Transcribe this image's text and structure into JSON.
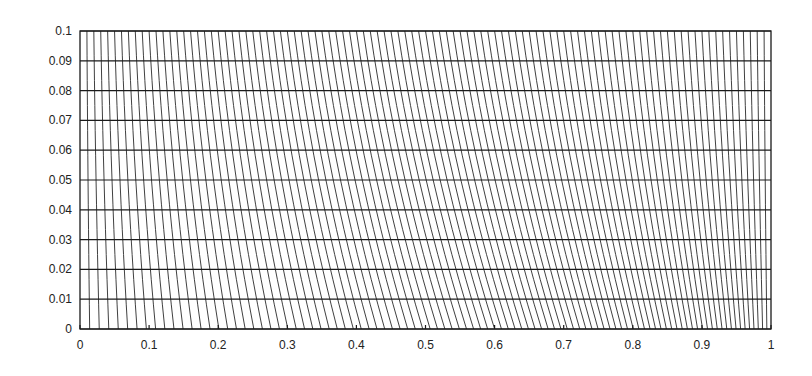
{
  "chart_data": {
    "type": "line",
    "title": "",
    "xlabel": "",
    "ylabel": "",
    "xlim": [
      0,
      1
    ],
    "ylim": [
      0,
      0.1
    ],
    "grid": true,
    "legend": null,
    "x_ticks": [
      0,
      0.1,
      0.2,
      0.3,
      0.4,
      0.5,
      0.6,
      0.7,
      0.8,
      0.9,
      1
    ],
    "x_tick_labels": [
      "0",
      "0.1",
      "0.2",
      "0.3",
      "0.4",
      "0.5",
      "0.6",
      "0.7",
      "0.8",
      "0.9",
      "1"
    ],
    "y_ticks": [
      0,
      0.01,
      0.02,
      0.03,
      0.04,
      0.05,
      0.06,
      0.07,
      0.08,
      0.09,
      0.1
    ],
    "y_tick_labels": [
      "0",
      "0.01",
      "0.02",
      "0.03",
      "0.04",
      "0.05",
      "0.06",
      "0.07",
      "0.08",
      "0.09",
      "0.1"
    ],
    "mesh": {
      "horizontal_lines_y": [
        0,
        0.01,
        0.02,
        0.03,
        0.04,
        0.05,
        0.06,
        0.07,
        0.08,
        0.09,
        0.1
      ],
      "vertical_line_count": 100,
      "top_distribution": "uniform",
      "bottom_grading_coefficient": 0.4,
      "note": "Vertical lines run from uniform spacing at y=0.1 to graded spacing at y=0 (coarser near x=0, finer near x=1), producing a rightward lean"
    }
  },
  "plot_area": {
    "left": 80,
    "top": 31,
    "right": 771,
    "bottom": 329
  },
  "colors": {
    "line": "#1a1a1a",
    "background": "#ffffff"
  }
}
